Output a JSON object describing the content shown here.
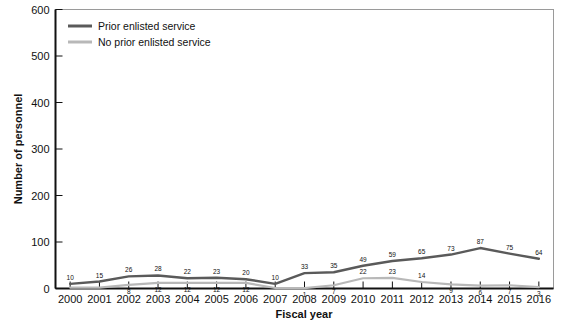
{
  "chart_data": {
    "type": "line",
    "title": "",
    "xlabel": "Fiscal year",
    "ylabel": "Number of personnel",
    "categories": [
      "2000",
      "2001",
      "2002",
      "2003",
      "2004",
      "2005",
      "2006",
      "2007",
      "2008",
      "2009",
      "2010",
      "2011",
      "2012",
      "2013",
      "2014",
      "2015",
      "2016"
    ],
    "x": [
      2000,
      2001,
      2002,
      2003,
      2004,
      2005,
      2006,
      2007,
      2008,
      2009,
      2010,
      2011,
      2012,
      2013,
      2014,
      2015,
      2016
    ],
    "ylim": [
      0,
      600
    ],
    "yticks": [
      0,
      100,
      200,
      300,
      400,
      500,
      600
    ],
    "ytick_labels": [
      "0",
      "100",
      "200",
      "300",
      "400",
      "500",
      "600"
    ],
    "grid": false,
    "legend_position": "top-left",
    "series": [
      {
        "name": "Prior enlisted service",
        "color": "#5a5a5a",
        "values": [
          10,
          15,
          26,
          28,
          22,
          23,
          20,
          10,
          33,
          35,
          49,
          59,
          65,
          73,
          87,
          75,
          64
        ],
        "labels": [
          "10",
          "15",
          "26",
          "28",
          "22",
          "23",
          "20",
          "10",
          "33",
          "35",
          "49",
          "59",
          "65",
          "73",
          "87",
          "75",
          "64"
        ]
      },
      {
        "name": "No prior enlisted service",
        "color": "#b8b8b8",
        "values": [
          2,
          2,
          8,
          12,
          12,
          12,
          12,
          1,
          1,
          7,
          22,
          23,
          14,
          9,
          6,
          7,
          3
        ],
        "labels": [
          "",
          "",
          "8",
          "12",
          "12",
          "12",
          "12",
          "",
          "1",
          "7",
          "22",
          "23",
          "14",
          "9",
          "6",
          "7",
          "3"
        ]
      }
    ]
  },
  "legend": {
    "items": [
      {
        "label": "Prior enlisted service",
        "color": "#5a5a5a"
      },
      {
        "label": "No prior enlisted service",
        "color": "#b8b8b8"
      }
    ]
  },
  "axes": {
    "y_title": "Number of personnel",
    "x_title": "Fiscal year"
  }
}
